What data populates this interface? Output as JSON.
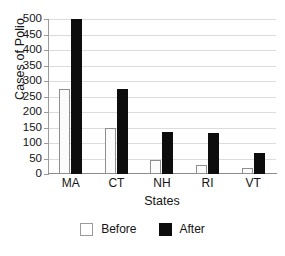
{
  "chart_data": {
    "type": "bar",
    "title": "",
    "categories": [
      "MA",
      "CT",
      "NH",
      "RI",
      "VT"
    ],
    "series": [
      {
        "name": "Before",
        "values": [
          275,
          150,
          45,
          30,
          20
        ],
        "color": "#ffffff"
      },
      {
        "name": "After",
        "values": [
          500,
          275,
          137,
          131,
          68
        ],
        "color": "#0d0d0d"
      }
    ],
    "xlabel": "States",
    "ylabel": "Cases of Polio",
    "ylim": [
      0,
      500
    ],
    "ytick_values": [
      0,
      50,
      100,
      150,
      200,
      250,
      300,
      350,
      400,
      450,
      500
    ],
    "ytick_labels": [
      "0",
      "50",
      "100",
      "150",
      "200",
      "250",
      "300",
      "350",
      "400",
      "450",
      "500"
    ],
    "grid": true,
    "grid_axis": "y",
    "legend_position": "bottom"
  },
  "legend": {
    "items": [
      {
        "label": "Before",
        "swatch": "open-square-swatch"
      },
      {
        "label": "After",
        "swatch": "filled-square-swatch"
      }
    ]
  },
  "axes": {
    "x_title": "States",
    "y_title": "Cases of Polio"
  }
}
